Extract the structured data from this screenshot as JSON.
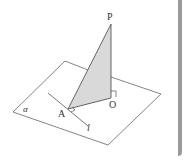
{
  "diagram": {
    "type": "3d-geometry",
    "plane_label": "α",
    "points": {
      "P": {
        "label": "P",
        "x": 111,
        "y": 24
      },
      "A": {
        "label": "A",
        "x": 68,
        "y": 109
      },
      "O": {
        "label": "O",
        "x": 111,
        "y": 98
      }
    },
    "line_label": "l",
    "colors": {
      "stroke": "#555555",
      "fill_triangle": "#d9d9d9",
      "frame": "#9a9a9a",
      "text": "#333333"
    }
  }
}
